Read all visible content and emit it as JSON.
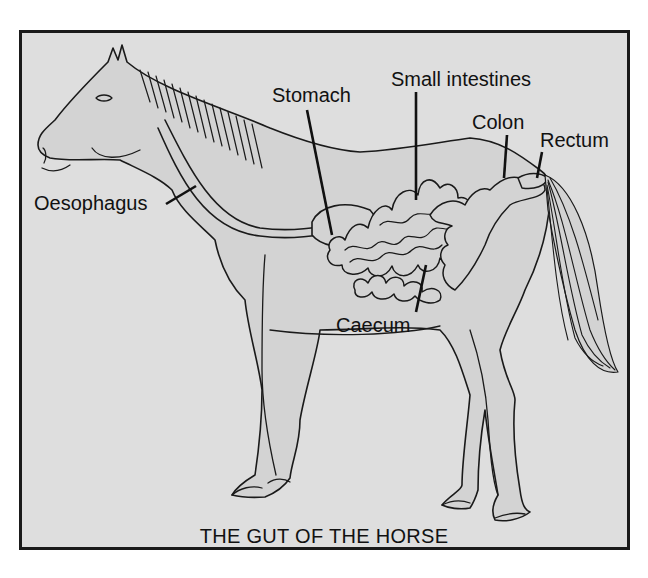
{
  "diagram": {
    "title": "THE GUT OF THE HORSE",
    "subject": "horse",
    "colors": {
      "page_background": "#ffffff",
      "frame_background": "#dedede",
      "body_fill": "#d3d3d3",
      "line": "#1a1a1a"
    },
    "labels": [
      {
        "id": "oesophagus",
        "text": "Oesophagus"
      },
      {
        "id": "stomach",
        "text": "Stomach"
      },
      {
        "id": "small_intestines",
        "text": "Small intestines"
      },
      {
        "id": "colon",
        "text": "Colon"
      },
      {
        "id": "rectum",
        "text": "Rectum"
      },
      {
        "id": "caecum",
        "text": "Caecum"
      }
    ]
  }
}
